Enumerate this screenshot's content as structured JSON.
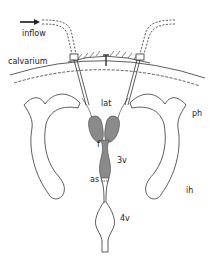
{
  "diagram": {
    "type": "anatomical-schematic",
    "colors": {
      "line": "#333333",
      "ventricle_fill": "#8a8a8a",
      "background": "#ffffff"
    },
    "labels": {
      "inflow": "inflow",
      "calvarium": "calvarium",
      "lateral_ventricle": "lat",
      "foramen": "f",
      "third_ventricle": "3v",
      "aqueduct_sylvius": "as",
      "fourth_ventricle": "4v",
      "posterior_horn": "ph",
      "inferior_horn": "ih"
    },
    "arrow": "right-arrow"
  }
}
